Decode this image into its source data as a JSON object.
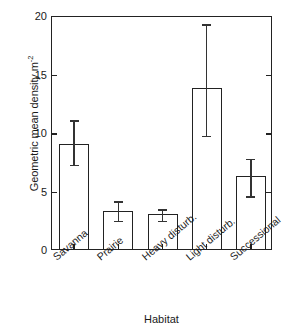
{
  "chart_data": {
    "type": "bar",
    "title": "",
    "subtitle": "",
    "xlabel": "Habitat",
    "ylabel": "Geometric mean density m",
    "ylabel_exponent": "-2",
    "ylabel_full": "Geometric mean density m-2",
    "categories": [
      "Savanna",
      "Prairie",
      "Heavy disturb.",
      "Light disturb.",
      "Successional"
    ],
    "values": [
      9.0,
      3.25,
      3.0,
      13.8,
      6.2
    ],
    "error_low": [
      7.3,
      2.5,
      2.5,
      9.8,
      4.6
    ],
    "error_high": [
      11.1,
      4.2,
      3.5,
      19.3,
      7.8
    ],
    "ylim": [
      0,
      20
    ],
    "yticks": [
      0,
      5,
      10,
      15,
      20
    ],
    "ytick_labels": [
      "0",
      "5",
      "10",
      "15",
      "20"
    ],
    "grid": false,
    "legend": "none",
    "bar_fill": "#ffffff",
    "bar_edge_color": "#222222",
    "error_bar_color": "#333333",
    "axis_color": "#222222",
    "background": "#ffffff"
  }
}
